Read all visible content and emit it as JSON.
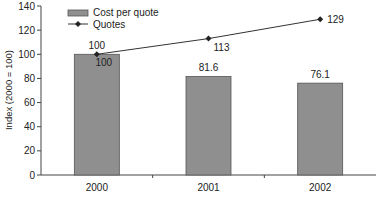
{
  "chart_data": {
    "type": "bar",
    "title": "",
    "xlabel": "",
    "ylabel": "Index (2000 = 100)",
    "ylim": [
      0,
      140
    ],
    "yticks": [
      0,
      20,
      40,
      60,
      80,
      100,
      120,
      140
    ],
    "grid": false,
    "legend_position": "top-left",
    "categories": [
      "2000",
      "2001",
      "2002"
    ],
    "series": [
      {
        "name": "Cost per quote",
        "type": "bar",
        "values": [
          100,
          81.6,
          76.1
        ],
        "labels": [
          "100",
          "81.6",
          "76.1"
        ],
        "color": "#8f8f8f"
      },
      {
        "name": "Quotes",
        "type": "line",
        "marker": "diamond",
        "values": [
          100,
          113,
          129
        ],
        "labels": [
          "100",
          "113",
          "129"
        ],
        "color": "#333333"
      }
    ]
  },
  "legend": {
    "items": [
      {
        "label": "Cost per quote",
        "icon": "bar-swatch-icon"
      },
      {
        "label": "Quotes",
        "icon": "line-diamond-icon"
      }
    ]
  }
}
